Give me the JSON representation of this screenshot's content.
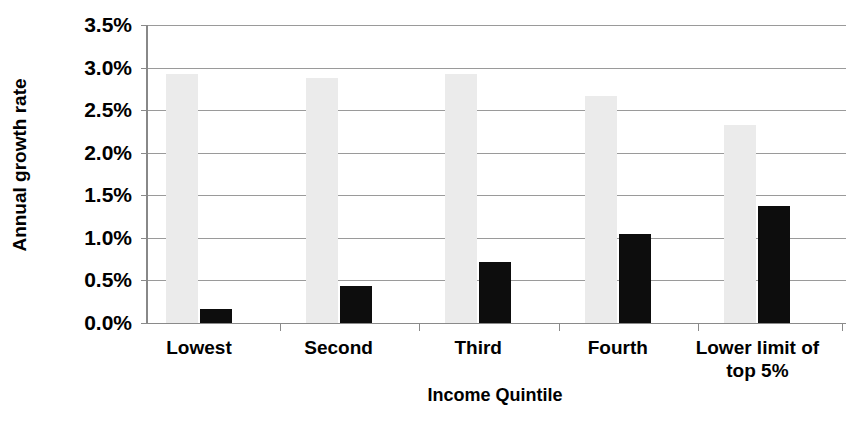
{
  "chart_data": {
    "type": "bar",
    "title": "",
    "subtitle": "",
    "xlabel": "Income Quintile",
    "ylabel": "Annual growth rate",
    "categories": [
      "Lowest",
      "Second",
      "Third",
      "Fourth",
      "Lower limit of\ntop 5%"
    ],
    "category_lines": [
      [
        "Lowest"
      ],
      [
        "Second"
      ],
      [
        "Third"
      ],
      [
        "Fourth"
      ],
      [
        "Lower limit of",
        "top 5%"
      ]
    ],
    "series": [
      {
        "name": "series-light",
        "color": "#ebebeb",
        "values": [
          2.92,
          2.88,
          2.92,
          2.67,
          2.33
        ]
      },
      {
        "name": "series-dark",
        "color": "#0d0d0d",
        "values": [
          0.16,
          0.43,
          0.72,
          1.04,
          1.38
        ]
      }
    ],
    "ylim": [
      0.0,
      3.5
    ],
    "ytick_values": [
      0.0,
      0.5,
      1.0,
      1.5,
      2.0,
      2.5,
      3.0,
      3.5
    ],
    "ytick_labels": [
      "0.0%",
      "0.5%",
      "1.0%",
      "1.5%",
      "2.0%",
      "2.5%",
      "3.0%",
      "3.5%"
    ],
    "grid": true,
    "grid_axis": "y",
    "legend": false,
    "legend_position": "none",
    "value_suffix": "%",
    "annotations": []
  },
  "axes": {
    "y_title": "Annual growth rate",
    "x_title": "Income Quintile"
  },
  "colors": {
    "background": "#ffffff",
    "gridline": "#9a9a9a",
    "axis": "#8a8a8a",
    "text": "#000000",
    "series_light": "#ebebeb",
    "series_dark": "#0d0d0d"
  }
}
